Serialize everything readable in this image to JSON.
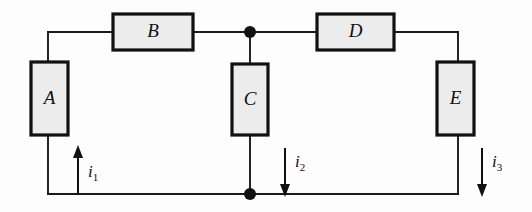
{
  "figure": {
    "background_color": "#fdfdfd",
    "wire_color": "#1a1a1a",
    "box_fill_color": "#ececed",
    "box_border_color": "#111111"
  },
  "components": [
    {
      "id": "A",
      "label": "A",
      "orientation": "vertical",
      "x": 31,
      "y": 62,
      "width": 37,
      "height": 73
    },
    {
      "id": "B",
      "label": "B",
      "orientation": "horizontal",
      "x": 113,
      "y": 14,
      "width": 80,
      "height": 36
    },
    {
      "id": "C",
      "label": "C",
      "orientation": "vertical",
      "x": 232,
      "y": 64,
      "width": 36,
      "height": 71
    },
    {
      "id": "D",
      "label": "D",
      "orientation": "horizontal",
      "x": 317,
      "y": 14,
      "width": 77,
      "height": 36
    },
    {
      "id": "E",
      "label": "E",
      "orientation": "vertical",
      "x": 437,
      "y": 62,
      "width": 37,
      "height": 73
    }
  ],
  "junctions": [
    {
      "id": "top-node",
      "x": 250,
      "y": 32,
      "radius": 6
    },
    {
      "id": "bottom-node",
      "x": 250,
      "y": 194,
      "radius": 6
    }
  ],
  "currents": [
    {
      "id": "i1",
      "label": "i",
      "subscript": "1",
      "direction": "up",
      "x": 78,
      "y_start": 194,
      "y_end": 148,
      "label_x": 88,
      "label_y": 172
    },
    {
      "id": "i2",
      "label": "i",
      "subscript": "2",
      "direction": "down",
      "x": 285,
      "y_start": 148,
      "y_end": 194,
      "label_x": 294,
      "label_y": 164
    },
    {
      "id": "i3",
      "label": "i",
      "subscript": "3",
      "direction": "down",
      "x": 482,
      "y_start": 148,
      "y_end": 194,
      "label_x": 491,
      "label_y": 164
    }
  ],
  "wires": {
    "top_rail_y": 32,
    "bottom_rail_y": 194,
    "left_rail_x": 48,
    "right_rail_x": 458,
    "branch_x": 250
  }
}
